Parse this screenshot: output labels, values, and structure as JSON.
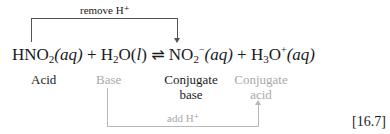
{
  "top_arrow": {
    "label": "remove H⁺"
  },
  "bottom_arrow": {
    "label": "add H⁺"
  },
  "equation": {
    "r1_main": "HNO",
    "r1_sub": "2",
    "r1_state": "(aq)",
    "plus1": "+",
    "r2_a": "H",
    "r2_sub": "2",
    "r2_b": "O(",
    "r2_state": "l",
    "r2_c": ")",
    "arrow": "⇌",
    "p1_main": "NO",
    "p1_sub": "2",
    "p1_sup": "−",
    "p1_state": "(aq)",
    "plus2": "+",
    "p2_a": "H",
    "p2_sub": "3",
    "p2_b": "O",
    "p2_sup": "+",
    "p2_state": "(aq)"
  },
  "labels": {
    "acid": "Acid",
    "base": "Base",
    "conj_base_1": "Conjugate",
    "conj_base_2": "base",
    "conj_acid_1": "Conjugate",
    "conj_acid_2": "acid"
  },
  "equation_number": "[16.7]",
  "colors": {
    "dark": "#1a1a1a",
    "gray": "#a8a8a8"
  }
}
